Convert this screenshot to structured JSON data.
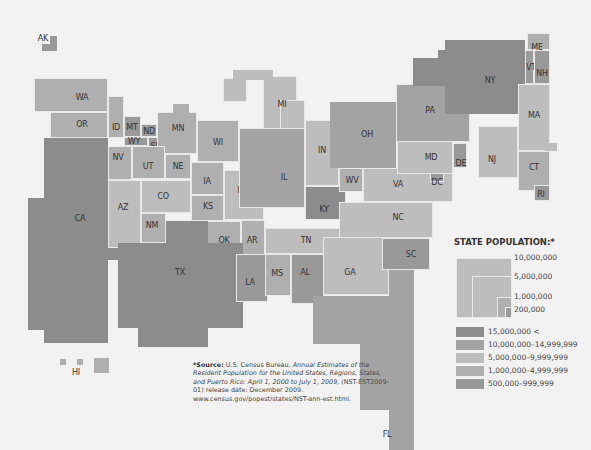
{
  "map": {
    "states": [
      {
        "abbr": "AK"
      },
      {
        "abbr": "WA"
      },
      {
        "abbr": "OR"
      },
      {
        "abbr": "ID"
      },
      {
        "abbr": "MT"
      },
      {
        "abbr": "ND"
      },
      {
        "abbr": "WY"
      },
      {
        "abbr": "SD"
      },
      {
        "abbr": "MN"
      },
      {
        "abbr": "NV"
      },
      {
        "abbr": "UT"
      },
      {
        "abbr": "NE"
      },
      {
        "abbr": "CA"
      },
      {
        "abbr": "AZ"
      },
      {
        "abbr": "CO"
      },
      {
        "abbr": "NM"
      },
      {
        "abbr": "IA"
      },
      {
        "abbr": "KS"
      },
      {
        "abbr": "WI"
      },
      {
        "abbr": "MI"
      },
      {
        "abbr": "MO"
      },
      {
        "abbr": "IL"
      },
      {
        "abbr": "IN"
      },
      {
        "abbr": "OH"
      },
      {
        "abbr": "KY"
      },
      {
        "abbr": "WV"
      },
      {
        "abbr": "OK"
      },
      {
        "abbr": "AR"
      },
      {
        "abbr": "TX"
      },
      {
        "abbr": "TN"
      },
      {
        "abbr": "LA"
      },
      {
        "abbr": "MS"
      },
      {
        "abbr": "AL"
      },
      {
        "abbr": "GA"
      },
      {
        "abbr": "FL"
      },
      {
        "abbr": "SC"
      },
      {
        "abbr": "NC"
      },
      {
        "abbr": "VA"
      },
      {
        "abbr": "DC"
      },
      {
        "abbr": "MD"
      },
      {
        "abbr": "DE"
      },
      {
        "abbr": "PA"
      },
      {
        "abbr": "NY"
      },
      {
        "abbr": "NJ"
      },
      {
        "abbr": "CT"
      },
      {
        "abbr": "RI"
      },
      {
        "abbr": "MA"
      },
      {
        "abbr": "VT"
      },
      {
        "abbr": "NH"
      },
      {
        "abbr": "ME"
      },
      {
        "abbr": "HI"
      }
    ]
  },
  "legend": {
    "title": "STATE POPULATION:*",
    "size_ticks": [
      "10,000,000",
      "5,000,000",
      "1,000,000",
      "200,000"
    ],
    "classes": [
      {
        "label": "15,000,000 <",
        "color": "#8c8c8c"
      },
      {
        "label": "10,000,000–14,999,999",
        "color": "#a3a3a3"
      },
      {
        "label": "5,000,000–9,999,999",
        "color": "#bdbdbd"
      },
      {
        "label": "1,000,000–4,999,999",
        "color": "#afafaf"
      },
      {
        "label": "500,000–999,999",
        "color": "#999999"
      }
    ]
  },
  "source": {
    "prefix": "*Source:",
    "agency": " U.S. Census Bureau, ",
    "title": "Annual Estimates of the Resident Population for the United States, Regions, States, and Puerto Rico: April 1, 2000 to July 1, 2009,",
    "release": " (NST-EST2009-01) release date: December 2009.",
    "url": "www.census.gov/popest/states/NST-ann-est.html."
  }
}
